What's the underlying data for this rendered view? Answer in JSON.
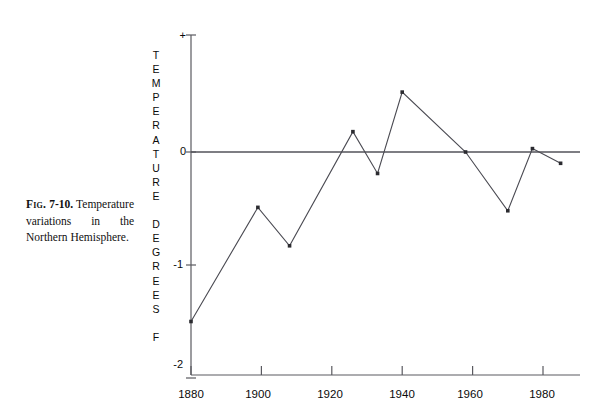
{
  "caption": {
    "fig_label": "Fig.",
    "fig_number": "7-10.",
    "text": "Temperature variations in the Northern Hemisphere."
  },
  "axis_title_letters": [
    "T",
    "E",
    "M",
    "P",
    "E",
    "R",
    "A",
    "T",
    "U",
    "R",
    "E",
    "",
    "D",
    "E",
    "G",
    "R",
    "E",
    "E",
    "S",
    "",
    "F"
  ],
  "ticks": {
    "y": [
      "+",
      "0",
      "-1",
      "-2"
    ],
    "x": [
      "1880",
      "1900",
      "1920",
      "1940",
      "1960",
      "1980"
    ]
  },
  "colors": {
    "line": "#4a4a52",
    "axis": "#5a5a60",
    "zero_line": "#53535a",
    "text": "#0a0a0a",
    "background": "#ffffff"
  },
  "chart_data": {
    "type": "line",
    "title": "Temperature variations in the Northern Hemisphere",
    "xlabel": "",
    "ylabel": "TEMPERATURE DEGREES F",
    "xlim": [
      1880,
      1988
    ],
    "ylim": [
      -2,
      0.6
    ],
    "grid": false,
    "legend": null,
    "zero_reference_line": 0,
    "markers": "square",
    "x": [
      1880,
      1899,
      1908,
      1926,
      1933,
      1940,
      1958,
      1970,
      1977,
      1985
    ],
    "values": [
      -1.5,
      -0.49,
      -0.83,
      0.18,
      -0.19,
      0.53,
      0.0,
      -0.52,
      0.03,
      -0.1
    ],
    "points": [
      {
        "year": 1880,
        "value": -1.5
      },
      {
        "year": 1899,
        "value": -0.49
      },
      {
        "year": 1908,
        "value": -0.83
      },
      {
        "year": 1926,
        "value": 0.18
      },
      {
        "year": 1933,
        "value": -0.19
      },
      {
        "year": 1940,
        "value": 0.53
      },
      {
        "year": 1958,
        "value": 0.0
      },
      {
        "year": 1970,
        "value": -0.52
      },
      {
        "year": 1977,
        "value": 0.03
      },
      {
        "year": 1985,
        "value": -0.1
      }
    ],
    "ytick_values": [
      0.6,
      0,
      -1,
      -2
    ],
    "ytick_labels": [
      "+",
      "0",
      "-1",
      "-2"
    ],
    "xtick_values": [
      1880,
      1900,
      1920,
      1940,
      1960,
      1980
    ],
    "xtick_labels": [
      "1880",
      "1900",
      "1920",
      "1940",
      "1960",
      "1980"
    ]
  }
}
